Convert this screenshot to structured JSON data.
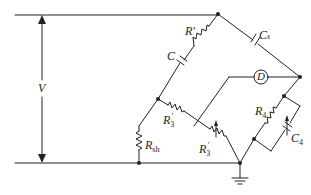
{
  "diagram": {
    "type": "circuit-schematic",
    "labels": {
      "voltage": "V",
      "r_prime": "R′",
      "c": "C",
      "cs": "C",
      "cs_sub": "s",
      "detector": "D",
      "r3_prime": "R",
      "r3_prime_sub": "3",
      "r3_prime_sup": "′",
      "r3_var": "R",
      "r3_var_sub": "3",
      "r3_var_sup": "′",
      "rsh": "R",
      "rsh_sub": "sh",
      "r4": "R",
      "r4_sub": "4",
      "c4": "C",
      "c4_sub": "4"
    },
    "components": [
      {
        "id": "V",
        "kind": "voltage-source-arrow"
      },
      {
        "id": "R'",
        "kind": "resistor"
      },
      {
        "id": "C",
        "kind": "capacitor"
      },
      {
        "id": "Cs",
        "kind": "capacitor"
      },
      {
        "id": "D",
        "kind": "detector"
      },
      {
        "id": "R3'",
        "kind": "resistor"
      },
      {
        "id": "R3'var",
        "kind": "variable-resistor"
      },
      {
        "id": "Rsh",
        "kind": "resistor"
      },
      {
        "id": "R4",
        "kind": "resistor"
      },
      {
        "id": "C4",
        "kind": "variable-capacitor"
      },
      {
        "id": "ground",
        "kind": "ground"
      }
    ],
    "colors": {
      "stroke": "#222222",
      "background": "#ffffff"
    }
  }
}
